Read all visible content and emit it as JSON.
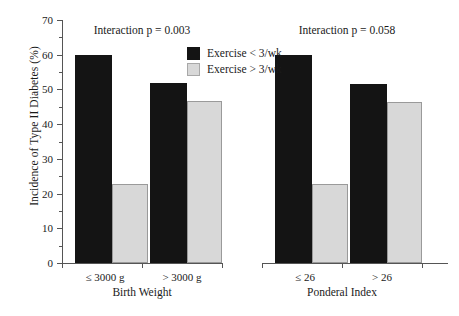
{
  "chart_data": {
    "type": "bar",
    "title": "",
    "ylabel": "Incidence of Type II Diabetes (%)",
    "ylim": [
      0,
      70
    ],
    "ytick_step": 10,
    "yticks": [
      0,
      10,
      20,
      30,
      40,
      50,
      60,
      70
    ],
    "ytick_labels": [
      "0",
      "10",
      "20",
      "30",
      "40",
      "50",
      "60",
      "70"
    ],
    "grid": false,
    "legend_position": "upper-center",
    "legend": [
      "Exercise < 3/wk",
      "Exercise > 3/wk"
    ],
    "colors": {
      "dark": "#141414",
      "light": "#d8d8d8",
      "light_edge": "#9a9a9a",
      "axis": "#555555",
      "text": "#1a1a1a",
      "background": "#ffffff"
    },
    "panels": [
      {
        "name": "birth-weight",
        "annotation": "Interaction p = 0.003",
        "xlabel": "Birth Weight",
        "categories": [
          "≤ 3000 g",
          "> 3000 g"
        ],
        "series": [
          {
            "name": "Exercise < 3/wk",
            "values": [
              60.0,
              51.8
            ]
          },
          {
            "name": "Exercise > 3/wk",
            "values": [
              22.7,
              46.7
            ]
          }
        ]
      },
      {
        "name": "ponderal-index",
        "annotation": "Interaction p = 0.058",
        "xlabel": "Ponderal Index",
        "categories": [
          "≤ 26",
          "> 26"
        ],
        "series": [
          {
            "name": "Exercise < 3/wk",
            "values": [
              60.0,
              51.5
            ]
          },
          {
            "name": "Exercise > 3/wk",
            "values": [
              22.7,
              46.5
            ]
          }
        ]
      }
    ]
  }
}
